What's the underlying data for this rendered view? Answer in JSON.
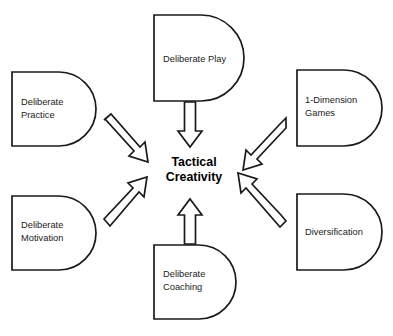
{
  "diagram": {
    "title_center": {
      "line1": "Tactical",
      "line2": "Creativity"
    },
    "nodes": [
      {
        "id": "deliberate-play",
        "label_line1": "Deliberate Play",
        "label_line2": "",
        "position": "top"
      },
      {
        "id": "deliberate-practice",
        "label_line1": "Deliberate",
        "label_line2": "Practice",
        "position": "top-left"
      },
      {
        "id": "one-dimension-games",
        "label_line1": "1-Dimension",
        "label_line2": "Games",
        "position": "top-right"
      },
      {
        "id": "deliberate-motivation",
        "label_line1": "Deliberate",
        "label_line2": "Motivation",
        "position": "bottom-left"
      },
      {
        "id": "diversification",
        "label_line1": "Diversification",
        "label_line2": "",
        "position": "bottom-right"
      },
      {
        "id": "deliberate-coaching",
        "label_line1": "Deliberate",
        "label_line2": "Coaching",
        "position": "bottom"
      }
    ],
    "arrows": [
      {
        "id": "arrow-play-to-center",
        "from": "deliberate-play",
        "to": "tactical-creativity",
        "direction": "down"
      },
      {
        "id": "arrow-practice-to-center",
        "from": "deliberate-practice",
        "to": "tactical-creativity",
        "direction": "down-right"
      },
      {
        "id": "arrow-games-to-center",
        "from": "one-dimension-games",
        "to": "tactical-creativity",
        "direction": "down-left"
      },
      {
        "id": "arrow-motivation-to-center",
        "from": "deliberate-motivation",
        "to": "tactical-creativity",
        "direction": "up-right"
      },
      {
        "id": "arrow-diversification-to-center",
        "from": "diversification",
        "to": "tactical-creativity",
        "direction": "up-left"
      },
      {
        "id": "arrow-coaching-to-center",
        "from": "deliberate-coaching",
        "to": "tactical-creativity",
        "direction": "up"
      }
    ],
    "colors": {
      "stroke": "#1a1a1a",
      "fill": "#ffffff",
      "text": "#1a1a1a",
      "background": "#ffffff"
    }
  }
}
